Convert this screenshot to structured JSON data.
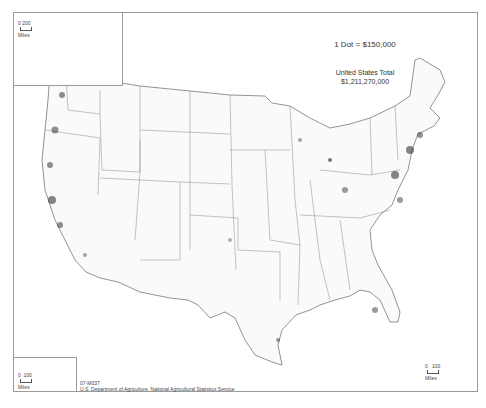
{
  "map": {
    "legend": {
      "dot_value": "1 Dot = $150,000"
    },
    "total": {
      "label": "United States Total",
      "value": "$1,211,270,000"
    },
    "insets": {
      "alaska": {
        "scale_ticks": [
          "0",
          "200"
        ],
        "scale_unit": "Miles"
      },
      "hawaii": {
        "scale_ticks": [
          "0",
          "100"
        ],
        "scale_unit": "Miles"
      }
    },
    "main_scale": {
      "scale_ticks": [
        "0",
        "100"
      ],
      "scale_unit": "Miles"
    },
    "footer": {
      "code": "07-M037",
      "source": "U.S. Department of Agriculture, National Agricultural Statistics Service"
    },
    "colors": {
      "border": "#9a9a9a",
      "state_lines": "#777777",
      "dots": "#222222"
    }
  }
}
